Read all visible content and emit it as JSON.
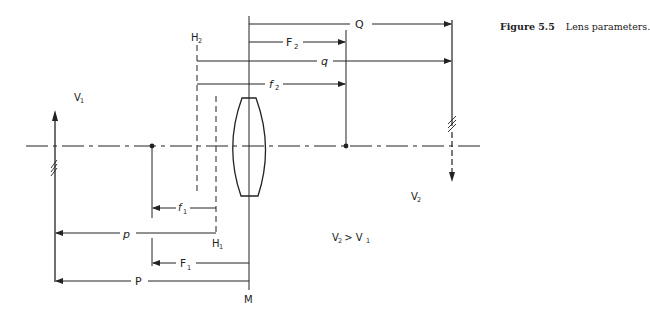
{
  "caption": {
    "number": "Figure 5.5",
    "text": "Lens parameters."
  },
  "labels": {
    "v1": "V",
    "v1_sub": "1",
    "v2": "V",
    "v2_sub": "2",
    "relation": "V",
    "relation_sub_a": "2",
    "relation_op": " > V",
    "relation_sub_b": "1",
    "h1": "H",
    "h1_sub": "1",
    "h2": "H",
    "h2_sub": "2",
    "m": "M"
  },
  "dimensions": {
    "Q": "Q",
    "F2": "F",
    "F2_sub": "2",
    "q": "q",
    "f2": "f",
    "f2_sub": "2",
    "f1": "f",
    "f1_sub": "1",
    "p": "p",
    "F1": "F",
    "F1_sub": "1",
    "P": "P"
  },
  "colors": {
    "line": "#222222",
    "background": "#ffffff"
  }
}
